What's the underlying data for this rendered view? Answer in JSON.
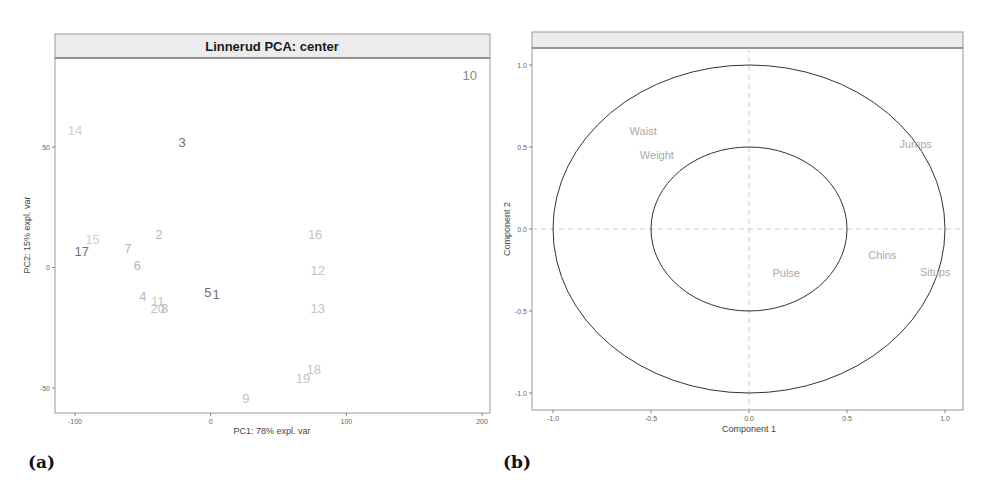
{
  "chart_data": [
    {
      "type": "scatter",
      "panel_label": "(a)",
      "title": "Linnerud PCA: center",
      "xlabel": "PC1: 78% expl. var",
      "ylabel": "PC2: 15% expl. var",
      "xlim": [
        -115,
        205
      ],
      "ylim": [
        -66,
        87
      ],
      "xticks": [
        -100,
        0,
        100,
        200
      ],
      "yticks": [
        -50,
        0,
        50
      ],
      "grid": false,
      "marker": "text-label",
      "points": [
        {
          "label": "1",
          "x": 4,
          "y": -11,
          "color": "#6f6f6f"
        },
        {
          "label": "2",
          "x": -38,
          "y": 14,
          "color": "#b8b8b8"
        },
        {
          "label": "3",
          "x": -21,
          "y": 52,
          "color": "#6f6f6f"
        },
        {
          "label": "4",
          "x": -50,
          "y": -12,
          "color": "#b8b8b8"
        },
        {
          "label": "5",
          "x": -2,
          "y": -10,
          "color": "#6f6f6f"
        },
        {
          "label": "6",
          "x": -54,
          "y": 1,
          "color": "#b8b8b8"
        },
        {
          "label": "7",
          "x": -61,
          "y": 8,
          "color": "#b8b8b8"
        },
        {
          "label": "8",
          "x": -34,
          "y": -17,
          "color": "#b8b8b8"
        },
        {
          "label": "9",
          "x": 26,
          "y": -54,
          "color": "#c4c4c4"
        },
        {
          "label": "10",
          "x": 191,
          "y": 80,
          "color": "#8a8a8a"
        },
        {
          "label": "11",
          "x": -39,
          "y": -14,
          "color": "#c4c4c4"
        },
        {
          "label": "12",
          "x": 79,
          "y": -1,
          "color": "#c4c4c4"
        },
        {
          "label": "13",
          "x": 79,
          "y": -17,
          "color": "#c4c4c4"
        },
        {
          "label": "14",
          "x": -100,
          "y": 57,
          "color": "#cfcfcf"
        },
        {
          "label": "15",
          "x": -87,
          "y": 12,
          "color": "#cfcfcf"
        },
        {
          "label": "16",
          "x": 77,
          "y": 14,
          "color": "#c4c4c4"
        },
        {
          "label": "17",
          "x": -95,
          "y": 7,
          "color": "#6f6f6f"
        },
        {
          "label": "18",
          "x": 76,
          "y": -42,
          "color": "#c4c4c4"
        },
        {
          "label": "19",
          "x": 68,
          "y": -46,
          "color": "#c4c4c4"
        },
        {
          "label": "20",
          "x": -39,
          "y": -17,
          "color": "#c4c4c4"
        }
      ]
    },
    {
      "type": "scatter",
      "subtype": "correlation-circle",
      "panel_label": "(b)",
      "title": "",
      "xlabel": "Component  1",
      "ylabel": "Component  2",
      "xlim": [
        -1.1,
        1.1
      ],
      "ylim": [
        -1.1,
        1.1
      ],
      "xticks": [
        -1.0,
        -0.5,
        0.0,
        0.5,
        1.0
      ],
      "xtick_labels": [
        "-1.0",
        "-0.5",
        "0.0",
        "0.5",
        "1.0"
      ],
      "yticks": [
        -1.0,
        -0.5,
        0.0,
        0.5,
        1.0
      ],
      "ytick_labels": [
        "-1.0",
        "-0.5",
        "0.0",
        "0.5",
        "1.0"
      ],
      "grid": false,
      "reference_lines": {
        "x": 0,
        "y": 0,
        "style": "dashed"
      },
      "circles": [
        {
          "name": "outer",
          "radius": 1.0
        },
        {
          "name": "inner",
          "radius": 0.5
        }
      ],
      "marker": "text-label",
      "variables": [
        {
          "label": "Waist",
          "x": -0.54,
          "y": 0.6
        },
        {
          "label": "Weight",
          "x": -0.47,
          "y": 0.45
        },
        {
          "label": "Jumps",
          "x": 0.85,
          "y": 0.52
        },
        {
          "label": "Chins",
          "x": 0.68,
          "y": -0.16
        },
        {
          "label": "Situps",
          "x": 0.95,
          "y": -0.26
        },
        {
          "label": "Pulse",
          "x": 0.19,
          "y": -0.27
        }
      ]
    }
  ]
}
